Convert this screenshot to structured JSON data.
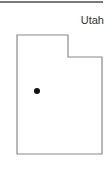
{
  "map": {
    "state_name": "Utah",
    "outline_color": "#8a8a8a",
    "marker": {
      "type": "city-dot",
      "color": "#111111"
    },
    "rule_color": "#7a7a7a"
  }
}
